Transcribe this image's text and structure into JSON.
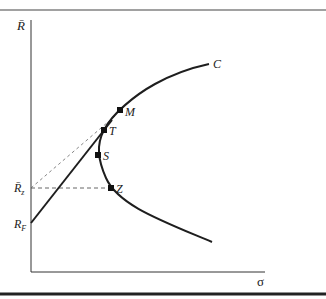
{
  "diagram": {
    "type": "efficient-frontier",
    "axes": {
      "y_label": "R̄",
      "x_label": "σ"
    },
    "labels": {
      "curve": "C",
      "point_M": "M",
      "point_T": "T",
      "point_S": "S",
      "point_Z": "Z",
      "rz_main": "R̄",
      "rz_sub": "z",
      "rf_main": "R",
      "rf_sub": "F"
    },
    "points": [
      {
        "name": "M",
        "x": 120,
        "y": 110
      },
      {
        "name": "T",
        "x": 104,
        "y": 130
      },
      {
        "name": "S",
        "x": 98,
        "y": 155
      },
      {
        "name": "Z",
        "x": 111,
        "y": 188
      }
    ],
    "colors": {
      "line": "#1e1e1e",
      "dashed": "#555555",
      "frame": "#333333",
      "background": "#ffffff"
    }
  }
}
